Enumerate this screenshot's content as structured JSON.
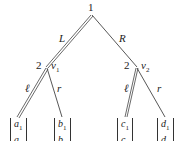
{
  "root": {
    "label": "1"
  },
  "edges": {
    "left": "L",
    "right": "R"
  },
  "nodes": [
    {
      "player": "2",
      "name": "v",
      "sub": "1",
      "left_action": "ℓ",
      "right_action": "r"
    },
    {
      "player": "2",
      "name": "v",
      "sub": "2",
      "left_action": "ℓ",
      "right_action": "r"
    }
  ],
  "leaves": [
    {
      "top": "a",
      "top_sub": "1",
      "bottom": "a",
      "bottom_sub": "2"
    },
    {
      "top": "b",
      "top_sub": "1",
      "bottom": "b",
      "bottom_sub": "2"
    },
    {
      "top": "c",
      "top_sub": "1",
      "bottom": "c",
      "bottom_sub": "2"
    },
    {
      "top": "d",
      "top_sub": "1",
      "bottom": "d",
      "bottom_sub": "2"
    }
  ]
}
